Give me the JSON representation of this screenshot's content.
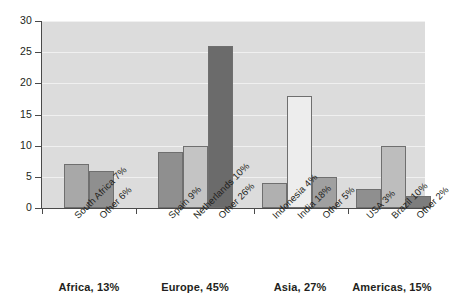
{
  "chart_data": {
    "type": "bar",
    "title": "",
    "subtitle": "",
    "xlabel": "",
    "ylabel": "",
    "ylim": [
      0,
      30
    ],
    "ytick_labels": [
      "0",
      "5",
      "10",
      "15",
      "20",
      "25",
      "30"
    ],
    "ytick_values": [
      0,
      5,
      10,
      15,
      20,
      25,
      30
    ],
    "grid": true,
    "legend": "none",
    "plot_background": "#dcdcdc",
    "categories": [
      "South Africa 7%",
      "Other 6%",
      "Spain 9%",
      "Netherlands 10%",
      "Other 26%",
      "Indonesia 4%",
      "India 18%",
      "Other 5%",
      "USA 3%",
      "Brazil 10%",
      "Other 2%"
    ],
    "values": [
      7,
      6,
      9,
      10,
      26,
      4,
      18,
      5,
      3,
      10,
      2
    ],
    "bar_colors": [
      "#a8a8a8",
      "#8f8f8f",
      "#8f8f8f",
      "#c4c4c4",
      "#6b6b6b",
      "#b0b0b0",
      "#ededed",
      "#a0a0a0",
      "#8f8f8f",
      "#bdbdbd",
      "#7d7d7d"
    ],
    "groups": [
      {
        "label": "Africa, 13%",
        "value": 13,
        "categories": [
          "South Africa 7%",
          "Other 6%"
        ]
      },
      {
        "label": "Europe, 45%",
        "value": 45,
        "categories": [
          "Spain 9%",
          "Netherlands 10%",
          "Other 26%"
        ]
      },
      {
        "label": "Asia, 27%",
        "value": 27,
        "categories": [
          "Indonesia 4%",
          "India 18%",
          "Other 5%"
        ]
      },
      {
        "label": "Americas, 15%",
        "value": 15,
        "categories": [
          "USA 3%",
          "Brazil 10%",
          "Other 2%"
        ]
      }
    ]
  }
}
